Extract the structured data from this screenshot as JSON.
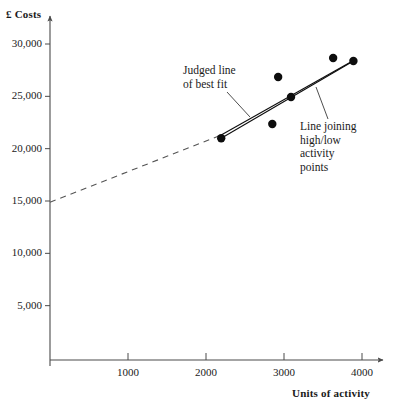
{
  "chart_data": {
    "type": "scatter",
    "title": "",
    "xlabel": "Units of activity",
    "ylabel": "£ Costs",
    "xlim": [
      0,
      4200
    ],
    "ylim": [
      0,
      31500
    ],
    "grid": false,
    "legend_position": "none",
    "x_ticks": [
      1000,
      2000,
      3000,
      4000
    ],
    "x_tick_labels": [
      "1000",
      "2000",
      "3000",
      "4000"
    ],
    "y_ticks": [
      5000,
      10000,
      15000,
      20000,
      25000,
      30000
    ],
    "y_tick_labels": [
      "5,000",
      "10,000",
      "15,000",
      "20,000",
      "25,000",
      "30,000"
    ],
    "points": [
      {
        "x": 2195,
        "y": 21000
      },
      {
        "x": 2850,
        "y": 22350
      },
      {
        "x": 3090,
        "y": 24930
      },
      {
        "x": 2925,
        "y": 26840
      },
      {
        "x": 3630,
        "y": 28660
      },
      {
        "x": 3890,
        "y": 28380
      }
    ],
    "series": [
      {
        "name": "Judged line of best fit",
        "style": "solid-with-dashed-extension",
        "solid_from": {
          "x": 2195,
          "y": 21300
        },
        "solid_to": {
          "x": 3890,
          "y": 28420
        },
        "dashed_from": {
          "x": 0,
          "y": 14880
        },
        "dashed_to": {
          "x": 2195,
          "y": 21300
        }
      },
      {
        "name": "Line joining high/low activity points",
        "style": "solid",
        "from": {
          "x": 2195,
          "y": 21000
        },
        "to": {
          "x": 3890,
          "y": 28380
        }
      }
    ],
    "annotations": [
      {
        "id": "best-fit",
        "text": "Judged line\nof best fit",
        "target_x": 2555,
        "target_y": 23200
      },
      {
        "id": "high-low",
        "text": "Line joining\nhigh/low\nactivity\npoints",
        "target_x": 3420,
        "target_y": 26000
      }
    ]
  },
  "axes": {
    "y_title": "£ Costs",
    "x_title": "Units of activity"
  },
  "colors": {
    "axis": "#4a4a4a",
    "point": "#0d0d0d",
    "line": "#0d0d0d",
    "text": "#1a1a1a",
    "background": "#ffffff"
  }
}
